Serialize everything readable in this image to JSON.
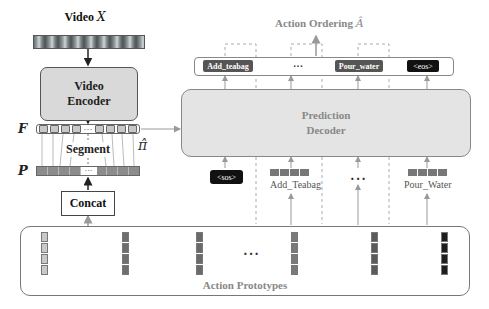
{
  "left_pipeline": {
    "video_label": "Video",
    "video_symbol": "X",
    "encoder_line1": "Video",
    "encoder_line2": "Encoder",
    "f_label": "F",
    "p_label": "P",
    "segment_label": "Segment",
    "pi_symbol": "π̂",
    "ellipsis": "···",
    "concat_label": "Concat"
  },
  "output": {
    "title": "Action Ordering",
    "title_symbol": "Â",
    "tokens": [
      {
        "label": "Add_teabag",
        "style": "gray"
      },
      {
        "label": "···",
        "style": "plain"
      },
      {
        "label": "Pour_water",
        "style": "gray"
      },
      {
        "label": "<eos>",
        "style": "black"
      }
    ]
  },
  "decoder": {
    "line1": "Prediction",
    "line2": "Decoder"
  },
  "decoder_inputs": [
    {
      "label": "<sos>",
      "style": "black"
    },
    {
      "label": "Add_Teabag",
      "style": "embedding"
    },
    {
      "label": "···",
      "style": "plain"
    },
    {
      "label": "Pour_Water",
      "style": "embedding"
    }
  ],
  "prototypes": {
    "label": "Action Prototypes",
    "ellipsis": "···",
    "column_colors": [
      "#c9c9c9",
      "#6e6e6e",
      "#6a6a6a",
      "#7a7a7a",
      "#5a5a5a",
      "#1e1e1e"
    ]
  },
  "colors": {
    "encoder_fill": "#d9d9d9",
    "decoder_fill": "#e4e4e4",
    "muted_text": "#888888",
    "token_gray": "#555555",
    "token_black": "#111111"
  }
}
